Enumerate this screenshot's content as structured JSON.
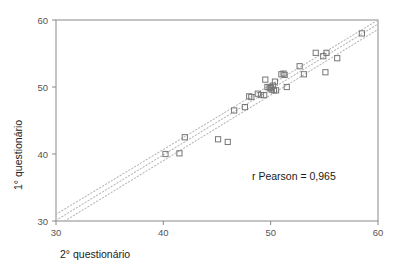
{
  "chart_data": {
    "type": "scatter",
    "title": "",
    "xlabel": "2° questionário",
    "ylabel": "1° questionário",
    "xlim": [
      30,
      60
    ],
    "ylim": [
      30,
      60
    ],
    "xticks": [
      "30",
      "40",
      "50",
      "60"
    ],
    "yticks": [
      "30",
      "40",
      "50",
      "60"
    ],
    "xtick_values": [
      30,
      40,
      50,
      60
    ],
    "ytick_values": [
      30,
      40,
      50,
      60
    ],
    "grid": false,
    "legend": null,
    "marker": "open-square",
    "marker_color": "#777777",
    "annotations": [
      {
        "text": "r Pearson = 0,965",
        "x": 51.5,
        "y": 36.0
      }
    ],
    "points": [
      {
        "x": 40.2,
        "y": 40.0
      },
      {
        "x": 41.5,
        "y": 40.1
      },
      {
        "x": 42.0,
        "y": 42.5
      },
      {
        "x": 45.1,
        "y": 42.2
      },
      {
        "x": 46.0,
        "y": 41.8
      },
      {
        "x": 46.6,
        "y": 46.5
      },
      {
        "x": 47.6,
        "y": 47.0
      },
      {
        "x": 48.0,
        "y": 48.6
      },
      {
        "x": 48.2,
        "y": 48.5
      },
      {
        "x": 48.8,
        "y": 49.0
      },
      {
        "x": 49.1,
        "y": 48.8
      },
      {
        "x": 49.4,
        "y": 48.8
      },
      {
        "x": 49.5,
        "y": 51.1
      },
      {
        "x": 49.7,
        "y": 50.0
      },
      {
        "x": 49.9,
        "y": 49.9
      },
      {
        "x": 50.0,
        "y": 50.0
      },
      {
        "x": 50.0,
        "y": 49.8
      },
      {
        "x": 50.1,
        "y": 49.6
      },
      {
        "x": 50.2,
        "y": 50.2
      },
      {
        "x": 50.3,
        "y": 49.5
      },
      {
        "x": 50.4,
        "y": 50.8
      },
      {
        "x": 50.5,
        "y": 49.5
      },
      {
        "x": 51.0,
        "y": 51.9
      },
      {
        "x": 51.2,
        "y": 52.0
      },
      {
        "x": 51.3,
        "y": 51.8
      },
      {
        "x": 51.5,
        "y": 50.0
      },
      {
        "x": 52.7,
        "y": 53.1
      },
      {
        "x": 53.1,
        "y": 51.9
      },
      {
        "x": 54.2,
        "y": 55.1
      },
      {
        "x": 54.9,
        "y": 54.6
      },
      {
        "x": 55.2,
        "y": 55.1
      },
      {
        "x": 55.1,
        "y": 52.2
      },
      {
        "x": 56.2,
        "y": 54.3
      },
      {
        "x": 58.5,
        "y": 58.0
      }
    ],
    "fit_lines": [
      {
        "name": "regression-line",
        "style": "dotted",
        "x1": 30.0,
        "y1": 30.1,
        "x2": 60.0,
        "y2": 59.4
      },
      {
        "name": "upper-confidence-band",
        "style": "dotted",
        "x1": 30.0,
        "y1": 31.0,
        "x2": 60.0,
        "y2": 60.0
      },
      {
        "name": "lower-confidence-band",
        "style": "dotted",
        "x1": 30.0,
        "y1": 29.2,
        "x2": 60.0,
        "y2": 58.6
      }
    ]
  },
  "colors": {
    "axis": "#8a8a8a",
    "marker": "#777777",
    "fit": "#b9b9b9",
    "text": "#1a1a1a",
    "tick": "#555555",
    "background": "#ffffff"
  }
}
